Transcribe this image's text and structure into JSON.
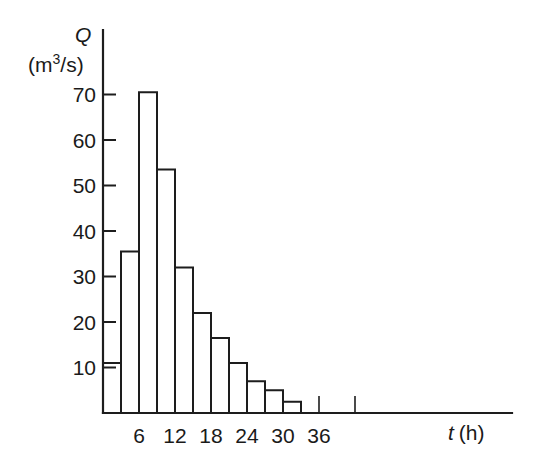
{
  "chart_data": {
    "type": "bar",
    "title": "",
    "subtitle": "",
    "xlabel": "t (h)",
    "xlabel_symbol": "t",
    "xlabel_unit": "(h)",
    "ylabel": "Q (m3/s)",
    "ylabel_symbol": "Q",
    "ylabel_unit": "(m3/s)",
    "ylabel_unit_base": "(m",
    "ylabel_unit_exp": "3",
    "ylabel_unit_tail": "/s)",
    "xlim": [
      0,
      46
    ],
    "ylim": [
      0,
      76
    ],
    "grid": false,
    "legend": null,
    "bar_width_hours": 3,
    "xticks": [
      6,
      12,
      18,
      24,
      30,
      36
    ],
    "xminor_ticks": [
      3,
      9,
      15,
      21,
      27,
      33
    ],
    "yticks": [
      10,
      20,
      30,
      40,
      50,
      60,
      70
    ],
    "categories": [
      "0-3",
      "3-6",
      "6-9",
      "9-12",
      "12-15",
      "15-18",
      "18-21",
      "21-24",
      "24-27",
      "27-30",
      "30-33"
    ],
    "bin_starts": [
      0,
      3,
      6,
      9,
      12,
      15,
      18,
      21,
      24,
      27,
      30
    ],
    "bin_ends": [
      3,
      6,
      9,
      12,
      15,
      18,
      21,
      24,
      27,
      30,
      33
    ],
    "values": [
      11,
      35.5,
      70.5,
      53.5,
      32,
      22,
      16.5,
      11,
      7,
      5,
      2.5
    ],
    "colors": {
      "bar_stroke": "#1d1d1d",
      "bar_fill": "none",
      "axis": "#1d1d1d",
      "text": "#1a1a1a",
      "background": "#ffffff"
    }
  },
  "axes": {
    "y_title_symbol": "Q",
    "y_title_unit_pre": "(m",
    "y_title_unit_sup": "3",
    "y_title_unit_post": "/s)",
    "x_title_symbol": "t",
    "x_title_unit": "(h)"
  },
  "y_tick_labels": [
    "70",
    "60",
    "50",
    "40",
    "30",
    "20",
    "10"
  ],
  "x_tick_labels": [
    "6",
    "12",
    "18",
    "24",
    "30",
    "36"
  ]
}
